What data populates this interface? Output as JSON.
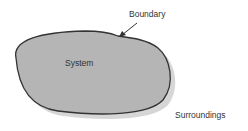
{
  "diagram": {
    "labels": {
      "boundary": "Boundary",
      "system": "System",
      "surroundings": "Surroundings"
    },
    "colors": {
      "system_fill": "#b5b5b5",
      "outline": "#333333",
      "shadow": "#d6d6d6",
      "text": "#333333"
    }
  }
}
